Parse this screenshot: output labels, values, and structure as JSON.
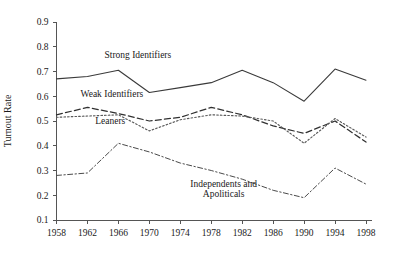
{
  "chart_data": {
    "type": "line",
    "title": "",
    "xlabel": "",
    "ylabel": "Turnout Rate",
    "x": [
      1958,
      1962,
      1966,
      1970,
      1974,
      1978,
      1982,
      1986,
      1990,
      1994,
      1998
    ],
    "xticklabels": [
      "1958",
      "1962",
      "1966",
      "1970",
      "1974",
      "1978",
      "1982",
      "1986",
      "1990",
      "1994",
      "1998"
    ],
    "yticklabels": [
      "0.1",
      "0.2",
      "0.3",
      "0.4",
      "0.5",
      "0.6",
      "0.7",
      "0.8",
      "0.9"
    ],
    "yticks": [
      0.1,
      0.2,
      0.3,
      0.4,
      0.5,
      0.6,
      0.7,
      0.8,
      0.9
    ],
    "ylim": [
      0.1,
      0.9
    ],
    "xlim": [
      1958,
      1998
    ],
    "grid": false,
    "legend_position": "inline-annotations",
    "series": [
      {
        "name": "Strong Identifiers",
        "style": "solid",
        "color": "#3a3a3a",
        "values": [
          0.67,
          0.68,
          0.705,
          0.615,
          0.635,
          0.655,
          0.705,
          0.655,
          0.58,
          0.71,
          0.665
        ]
      },
      {
        "name": "Weak Identifiers",
        "style": "dashed",
        "color": "#303030",
        "values": [
          0.525,
          0.555,
          0.53,
          0.5,
          0.515,
          0.555,
          0.525,
          0.48,
          0.45,
          0.5,
          0.415
        ]
      },
      {
        "name": "Leaners",
        "style": "dotted",
        "color": "#5a5a5a",
        "values": [
          0.515,
          0.52,
          0.525,
          0.46,
          0.505,
          0.525,
          0.52,
          0.5,
          0.41,
          0.51,
          0.435
        ]
      },
      {
        "name": "Independents and Apoliticals",
        "style": "dash-dot",
        "color": "#4a4a4a",
        "values": [
          0.28,
          0.29,
          0.41,
          0.375,
          0.33,
          0.3,
          0.265,
          0.22,
          0.19,
          0.31,
          0.245
        ]
      }
    ],
    "annotations": [
      {
        "text": "Strong Identifiers",
        "x": 1964.2,
        "y": 0.755
      },
      {
        "text": "Weak Identifiers",
        "x": 1961.1,
        "y": 0.598
      },
      {
        "text": "Leaners",
        "x": 1963.0,
        "y": 0.487
      },
      {
        "text": "Independents and",
        "x": 1979.6,
        "y": 0.235
      },
      {
        "text": "Apoliticals",
        "x": 1979.6,
        "y": 0.192
      }
    ]
  }
}
